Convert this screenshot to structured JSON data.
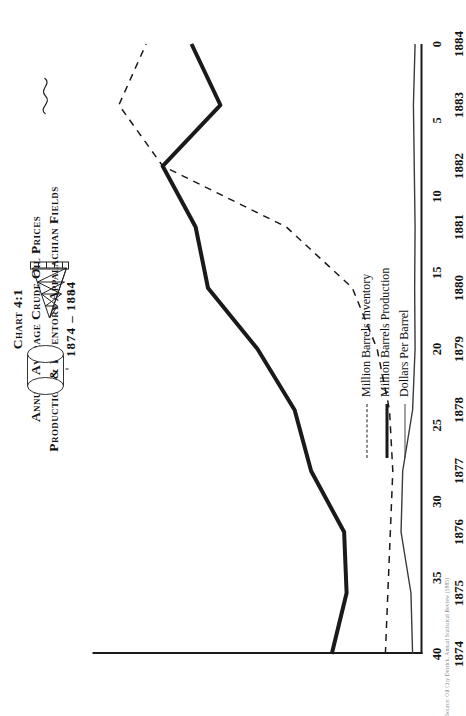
{
  "title": {
    "line1": "Chart 4:1",
    "line2": "Annual Average Crude Oil Prices",
    "line3": "Production & Inventory Appalachian Fields",
    "line4": "1874 – 1884"
  },
  "legend": {
    "position": "inside-right",
    "items": [
      {
        "label": "Million Barrels Inventory",
        "style": "dashed",
        "icon": "dashed-line-icon"
      },
      {
        "label": "Million Barrels Production",
        "style": "thick",
        "icon": "thick-line-icon"
      },
      {
        "label": "Dollars Per Barrel",
        "style": "thin",
        "icon": "thin-line-icon"
      }
    ]
  },
  "annotations": {
    "tank_icon": "storage-tank-icon",
    "derrick_icon": "oil-derrick-icon",
    "squiggle_icon": "flourish-icon"
  },
  "source_note": "Source: Oil City Derrick, Annual Statistical Review (1885)",
  "chart_data": {
    "type": "line",
    "xlabel": "",
    "ylabel": "",
    "orientation": "rotated-90",
    "grid": false,
    "legend_position": "inside-right",
    "x": [
      1874,
      1875,
      1876,
      1877,
      1878,
      1879,
      1880,
      1881,
      1882,
      1883,
      1884
    ],
    "xtick_labels": [
      "1874",
      "1875",
      "1876",
      "1877",
      "1878",
      "1879",
      "1880",
      "1881",
      "1882",
      "1883",
      "1884"
    ],
    "ylim": [
      0,
      40
    ],
    "ytick_values": [
      0,
      5,
      10,
      15,
      20,
      25,
      30,
      35,
      40
    ],
    "ytick_labels": [
      "0",
      "5",
      "10",
      "15",
      "20",
      "25",
      "30",
      "35",
      "40"
    ],
    "series": [
      {
        "name": "Million Barrels Inventory",
        "style": "dashed",
        "values": [
          4.5,
          4.2,
          3.9,
          3.6,
          4.0,
          5.5,
          8.5,
          16.5,
          31.5,
          36.8,
          33.5
        ]
      },
      {
        "name": "Million Barrels Production",
        "style": "thick",
        "values": [
          11.0,
          9.2,
          9.5,
          13.5,
          15.5,
          20.0,
          26.0,
          27.5,
          31.5,
          24.5,
          28.0
        ]
      },
      {
        "name": "Dollars Per Barrel",
        "style": "thin",
        "values": [
          1.2,
          1.4,
          2.6,
          2.4,
          1.2,
          0.9,
          0.95,
          0.9,
          1.0,
          1.1,
          0.9
        ]
      }
    ]
  }
}
